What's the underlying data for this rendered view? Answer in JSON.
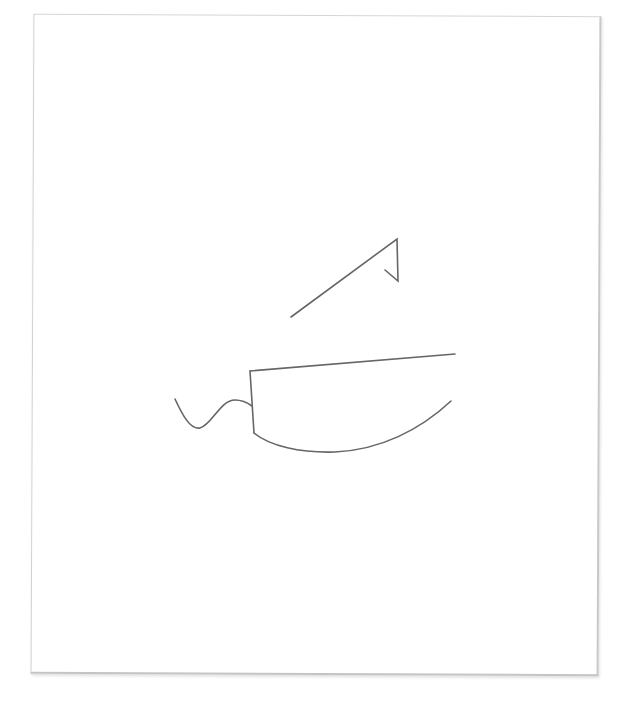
{
  "canvas": {
    "background": "#ffffff",
    "paper_color": "#ffffff",
    "stroke_color": "#666666"
  },
  "drawing": {
    "subject": "knife sketch",
    "strokes": [
      {
        "name": "upper-diagonal-stroke",
        "description": "diagonal line with hooked end"
      },
      {
        "name": "blade-spine-stroke",
        "description": "top edge of blade"
      },
      {
        "name": "blade-heel-stroke",
        "description": "vertical heel of blade"
      },
      {
        "name": "blade-edge-stroke",
        "description": "curved cutting edge"
      },
      {
        "name": "handle-squiggle-stroke",
        "description": "wavy handle line"
      }
    ]
  }
}
